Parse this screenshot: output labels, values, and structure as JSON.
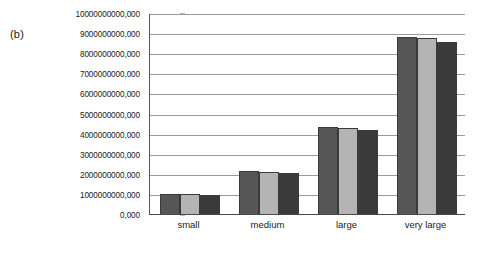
{
  "figure": {
    "panel_label": "(b)"
  },
  "chart_data": {
    "type": "bar",
    "title": "",
    "subtitle": "",
    "xlabel": "",
    "ylabel": "",
    "categories": [
      "small",
      "medium",
      "large",
      "very large"
    ],
    "series": [
      {
        "name": "series-1",
        "color": "#565656",
        "values": [
          1050000000000,
          2200000000000,
          4400000000000,
          8850000000000
        ]
      },
      {
        "name": "series-2",
        "color": "#b4b4b4",
        "values": [
          1050000000000,
          2150000000000,
          4350000000000,
          8800000000000
        ]
      },
      {
        "name": "series-3",
        "color": "#3a3a3a",
        "values": [
          1000000000000,
          2100000000000,
          4250000000000,
          8600000000000
        ]
      }
    ],
    "ylim": [
      0,
      10000000000000
    ],
    "ytick_values": [
      0,
      1000000000000,
      2000000000000,
      3000000000000,
      4000000000000,
      5000000000000,
      6000000000000,
      7000000000000,
      8000000000000,
      9000000000000,
      10000000000000
    ],
    "ytick_labels": [
      "0,000",
      "1000000000,000",
      "2000000000,000",
      "3000000000,000",
      "4000000000,000",
      "5000000000,000",
      "6000000000,000",
      "7000000000,000",
      "8000000000,000",
      "9000000000,000",
      "10000000000,000"
    ],
    "grid": true,
    "grid_axis": "y",
    "legend": false,
    "legend_position": "none",
    "annotations": []
  },
  "colors": {
    "background": "#ffffff",
    "gridline": "#9a9a9a",
    "axis": "#4a4a4a",
    "text": "#1a1a1a"
  }
}
